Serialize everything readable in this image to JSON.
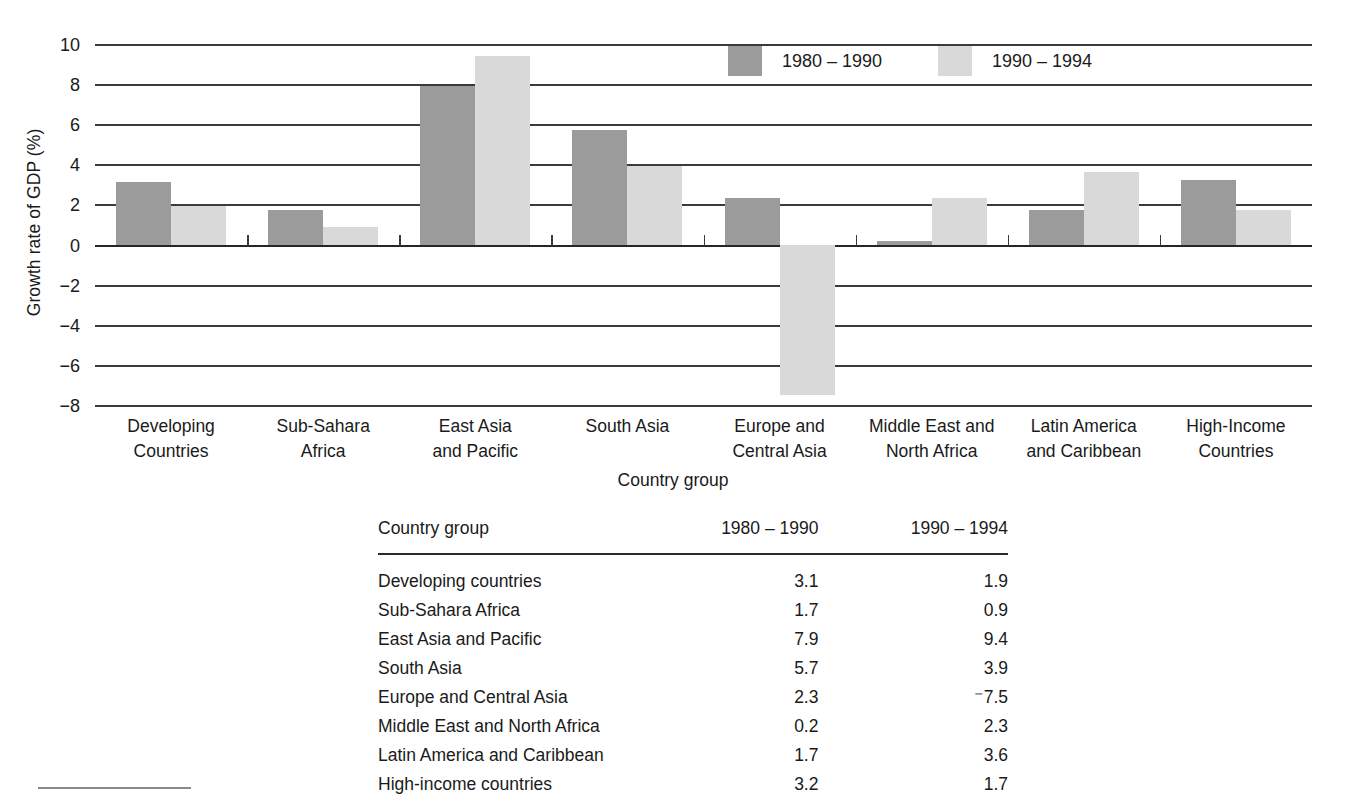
{
  "chart_data": {
    "type": "bar",
    "title": "",
    "xlabel": "Country group",
    "ylabel": "Growth rate of GDP (%)",
    "ylim": [
      -8,
      10
    ],
    "ytick_step": 2,
    "yticks": [
      10,
      8,
      6,
      4,
      2,
      0,
      "-2",
      "-4",
      "-6",
      "-8"
    ],
    "grid": true,
    "legend_position": "top-center",
    "categories": [
      "Developing Countries",
      "Sub-Sahara Africa",
      "East Asia and Pacific",
      "South Asia",
      "Europe and Central Asia",
      "Middle East and North Africa",
      "Latin America and Caribbean",
      "High-Income Countries"
    ],
    "category_lines": [
      [
        "Developing",
        "Countries"
      ],
      [
        "Sub-Sahara",
        "Africa"
      ],
      [
        "East Asia",
        "and Pacific"
      ],
      [
        "South Asia",
        ""
      ],
      [
        "Europe and",
        "Central Asia"
      ],
      [
        "Middle East and",
        "North Africa"
      ],
      [
        "Latin America",
        "and Caribbean"
      ],
      [
        "High-Income",
        "Countries"
      ]
    ],
    "series": [
      {
        "name": "1980 – 1990",
        "color": "#9b9b9b",
        "values": [
          3.1,
          1.7,
          7.9,
          5.7,
          2.3,
          0.2,
          1.7,
          3.2
        ]
      },
      {
        "name": "1990 – 1994",
        "color": "#d9d9d9",
        "values": [
          1.9,
          0.9,
          9.4,
          3.9,
          -7.5,
          2.3,
          3.6,
          1.7
        ]
      }
    ]
  },
  "legend": {
    "items": [
      {
        "label": "1980 – 1990",
        "color": "#9b9b9b"
      },
      {
        "label": "1990 – 1994",
        "color": "#d9d9d9"
      }
    ]
  },
  "table": {
    "headers": [
      "Country group",
      "1980 – 1990",
      "1990 – 1994"
    ],
    "rows": [
      {
        "group": "Developing  countries",
        "v1": "3.1",
        "v2": "1.9"
      },
      {
        "group": "Sub-Sahara Africa",
        "v1": "1.7",
        "v2": "0.9"
      },
      {
        "group": "East Asia and Pacific",
        "v1": "7.9",
        "v2": "9.4"
      },
      {
        "group": "South Asia",
        "v1": "5.7",
        "v2": "3.9"
      },
      {
        "group": "Europe and Central Asia",
        "v1": "2.3",
        "v2": "-7.5"
      },
      {
        "group": "Middle East and North Africa",
        "v1": "0.2",
        "v2": "2.3"
      },
      {
        "group": "Latin America and Caribbean",
        "v1": "1.7",
        "v2": "3.6"
      },
      {
        "group": "High-income countries",
        "v1": "3.2",
        "v2": "1.7"
      }
    ]
  }
}
